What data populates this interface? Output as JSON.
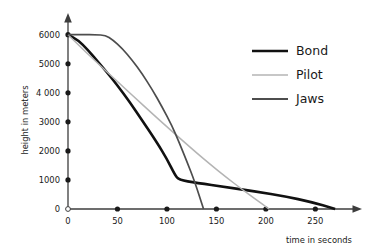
{
  "chart_data": {
    "type": "line",
    "title": "",
    "xlabel": "time in seconds",
    "ylabel": "height in meters",
    "xlim": [
      0,
      283
    ],
    "ylim": [
      0,
      6300
    ],
    "grid": false,
    "legend_position": "upper-right",
    "xticks": [
      0,
      50,
      100,
      150,
      200,
      250
    ],
    "xtick_labels": [
      "0",
      "50",
      "100",
      "150",
      "200",
      "250"
    ],
    "yticks": [
      0,
      1000,
      2000,
      3000,
      4000,
      5000,
      6000
    ],
    "ytick_labels": [
      "0",
      "1000",
      "2000",
      "3000",
      "4 000",
      "5000",
      "6000"
    ],
    "series": [
      {
        "name": "Bond",
        "color": "#111111",
        "width": 2.6,
        "points": [
          [
            0,
            6000
          ],
          [
            10,
            5820
          ],
          [
            20,
            5480
          ],
          [
            30,
            5080
          ],
          [
            40,
            4680
          ],
          [
            50,
            4250
          ],
          [
            62,
            3700
          ],
          [
            75,
            3050
          ],
          [
            90,
            2280
          ],
          [
            100,
            1720
          ],
          [
            108,
            1180
          ],
          [
            112,
            1000
          ],
          [
            130,
            900
          ],
          [
            160,
            750
          ],
          [
            190,
            600
          ],
          [
            220,
            430
          ],
          [
            245,
            250
          ],
          [
            270,
            0
          ]
        ]
      },
      {
        "name": "Pilot",
        "color": "#b4b4b4",
        "width": 1.5,
        "points": [
          [
            0,
            6000
          ],
          [
            12,
            5600
          ],
          [
            25,
            5180
          ],
          [
            40,
            4700
          ],
          [
            55,
            4230
          ],
          [
            70,
            3760
          ],
          [
            85,
            3290
          ],
          [
            100,
            2830
          ],
          [
            115,
            2380
          ],
          [
            130,
            1930
          ],
          [
            145,
            1500
          ],
          [
            160,
            1090
          ],
          [
            175,
            700
          ],
          [
            190,
            330
          ],
          [
            203,
            0
          ]
        ]
      },
      {
        "name": "Jaws",
        "color": "#4d4d4d",
        "width": 1.7,
        "points": [
          [
            0,
            6000
          ],
          [
            15,
            6000
          ],
          [
            28,
            6000
          ],
          [
            38,
            5980
          ],
          [
            45,
            5830
          ],
          [
            55,
            5520
          ],
          [
            65,
            5120
          ],
          [
            75,
            4650
          ],
          [
            85,
            4120
          ],
          [
            95,
            3520
          ],
          [
            105,
            2870
          ],
          [
            112,
            2320
          ],
          [
            120,
            1650
          ],
          [
            128,
            950
          ],
          [
            137,
            0
          ]
        ]
      }
    ]
  },
  "legend": {
    "items": [
      {
        "label": "Bond"
      },
      {
        "label": "Pilot"
      },
      {
        "label": "Jaws"
      }
    ]
  }
}
